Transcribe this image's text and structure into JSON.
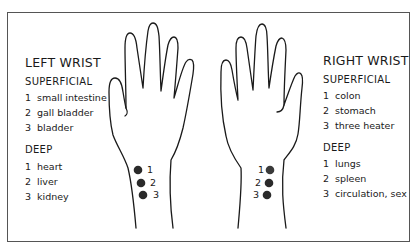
{
  "left_wrist": {
    "title": "LEFT WRIST",
    "superficial": {
      "label": "SUPERFICIAL",
      "items": [
        {
          "num": "1",
          "organ": "small intestine"
        },
        {
          "num": "2",
          "organ": "gall bladder"
        },
        {
          "num": "3",
          "organ": "bladder"
        }
      ]
    },
    "deep": {
      "label": "DEEP",
      "items": [
        {
          "num": "1",
          "organ": "heart"
        },
        {
          "num": "2",
          "organ": "liver"
        },
        {
          "num": "3",
          "organ": "kidney"
        }
      ]
    },
    "pulse_points": [
      "1",
      "2",
      "3"
    ]
  },
  "right_wrist": {
    "title": "RIGHT WRIST",
    "superficial": {
      "label": "SUPERFICIAL",
      "items": [
        {
          "num": "1",
          "organ": "colon"
        },
        {
          "num": "2",
          "organ": "stomach"
        },
        {
          "num": "3",
          "organ": "three heater"
        }
      ]
    },
    "deep": {
      "label": "DEEP",
      "items": [
        {
          "num": "1",
          "organ": "lungs"
        },
        {
          "num": "2",
          "organ": "spleen"
        },
        {
          "num": "3",
          "organ": "circulation, sex"
        }
      ]
    },
    "pulse_points": [
      "1",
      "2",
      "3"
    ]
  },
  "colors": {
    "line": "#1a1a1a",
    "dot": "#2a2a2a",
    "border": "#555555"
  }
}
